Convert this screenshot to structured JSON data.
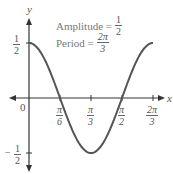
{
  "chart_data": {
    "type": "line",
    "function": "y = (1/2) cos(3x)",
    "title": "",
    "xlabel": "x",
    "ylabel": "y",
    "xlim": [
      0,
      2.0944
    ],
    "ylim": [
      -0.5,
      0.5
    ],
    "x_ticks": [
      {
        "value": 0.5236,
        "num": "π",
        "den": "6"
      },
      {
        "value": 1.0472,
        "num": "π",
        "den": "3"
      },
      {
        "value": 1.5708,
        "num": "π",
        "den": "2"
      },
      {
        "value": 2.0944,
        "num": "2π",
        "den": "3"
      }
    ],
    "y_ticks": [
      {
        "value": 0.5,
        "sign": "",
        "num": "1",
        "den": "2"
      },
      {
        "value": -0.5,
        "sign": "−",
        "num": "1",
        "den": "2"
      }
    ],
    "origin_label": "0",
    "series": [
      {
        "name": "y = ½cos(3x)",
        "color": "#555555",
        "x": [
          0,
          0.2618,
          0.5236,
          0.7854,
          1.0472,
          1.309,
          1.5708,
          1.8326,
          2.0944
        ],
        "y": [
          0.5,
          0.3536,
          0,
          -0.3536,
          -0.5,
          -0.3536,
          0,
          0.3536,
          0.5
        ]
      }
    ],
    "annotations": [
      {
        "label": "Amplitude =",
        "num": "1",
        "den": "2"
      },
      {
        "label": "Period =",
        "num": "2π",
        "den": "3"
      }
    ],
    "grid": false,
    "legend": "none"
  },
  "axes": {
    "x_label": "x",
    "y_label": "y",
    "origin": "0"
  },
  "annotations": {
    "amplitude": {
      "label": "Amplitude =",
      "num": "1",
      "den": "2"
    },
    "period": {
      "label": "Period =",
      "num": "2π",
      "den": "3"
    }
  },
  "ticks": {
    "x1": {
      "num": "π",
      "den": "6"
    },
    "x2": {
      "num": "π",
      "den": "3"
    },
    "x3": {
      "num": "π",
      "den": "2"
    },
    "x4": {
      "num": "2π",
      "den": "3"
    },
    "y_pos": {
      "num": "1",
      "den": "2"
    },
    "y_neg": {
      "sign": "−",
      "num": "1",
      "den": "2"
    }
  }
}
